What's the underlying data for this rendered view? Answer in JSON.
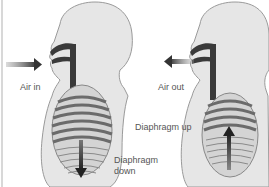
{
  "diagram": {
    "type": "breathing-mechanics",
    "panels": [
      {
        "name": "inhale",
        "labels": {
          "air": "Air in",
          "diaphragm_line1": "Diaphragm",
          "diaphragm_line2": "down"
        },
        "air_arrow_direction": "right",
        "diaphragm_arrow_direction": "down"
      },
      {
        "name": "exhale",
        "labels": {
          "air": "Air out",
          "diaphragm": "Diaphragm up"
        },
        "air_arrow_direction": "left",
        "diaphragm_arrow_direction": "up"
      }
    ],
    "colors": {
      "body_fill": "#e6e6e6",
      "body_outline": "#9a9a9a",
      "airway": "#3a3a3a",
      "rib_dark": "#6b6b6b",
      "arrow": "#444444",
      "text": "#555555"
    }
  }
}
